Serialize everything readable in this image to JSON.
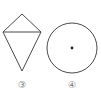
{
  "figures": [
    {
      "label": "③",
      "shape": "kite",
      "description": "kite with horizontal diagonal",
      "vertices": {
        "top": [
          22,
          14
        ],
        "left": [
          3,
          32
        ],
        "right": [
          41,
          32
        ],
        "bottom": [
          22,
          71
        ]
      }
    },
    {
      "label": "④",
      "shape": "circle",
      "description": "circle with center dot",
      "center": [
        72,
        48
      ],
      "radius": 25
    }
  ],
  "colors": {
    "stroke": "#4a4a4a",
    "label": "#777777",
    "background": "#ffffff"
  }
}
